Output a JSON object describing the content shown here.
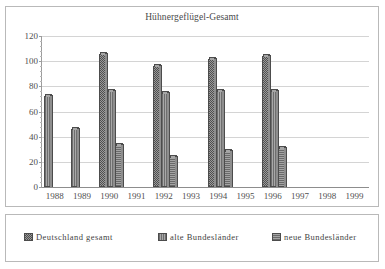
{
  "chart_data": {
    "type": "bar",
    "title": "Hühnergeflügel-Gesamt",
    "xlabel": "",
    "ylabel": "",
    "ylim": [
      0,
      120
    ],
    "ytick_step": 20,
    "yticks": [
      0,
      20,
      40,
      60,
      80,
      100,
      120
    ],
    "grid": true,
    "legend_position": "bottom",
    "categories": [
      "1988",
      "1989",
      "1990",
      "1991",
      "1992",
      "1993",
      "1994",
      "1995",
      "1996",
      "1997",
      "1998",
      "1999"
    ],
    "series": [
      {
        "name": "Deutschland gesamt",
        "color": "#9a9a9a",
        "values": [
          null,
          null,
          106,
          null,
          96,
          null,
          102,
          null,
          104,
          null,
          null,
          null
        ]
      },
      {
        "name": "alte Bundesländer",
        "color": "#909090",
        "values": [
          72,
          46,
          76,
          null,
          75,
          null,
          76,
          null,
          76,
          null,
          null,
          null
        ]
      },
      {
        "name": "neue Bundesländer",
        "color": "#8a8a8a",
        "values": [
          null,
          null,
          33,
          null,
          24,
          null,
          29,
          null,
          31,
          null,
          null,
          null
        ]
      }
    ]
  },
  "legend": {
    "items": [
      {
        "label": "Deutschland gesamt"
      },
      {
        "label": "alte Bundesländer"
      },
      {
        "label": "neue Bundesländer"
      }
    ]
  }
}
